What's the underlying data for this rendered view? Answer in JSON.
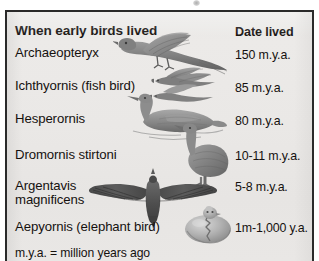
{
  "figure": {
    "title": "When early birds lived",
    "columns": {
      "name_header": "When early birds lived",
      "date_header": "Date lived"
    },
    "rows": [
      {
        "name": "Archaeopteryx",
        "date": "150 m.y.a.",
        "art": "bird-flying-archaeopteryx"
      },
      {
        "name": "Ichthyornis (fish bird)",
        "date": "85 m.y.a.",
        "art": "bird-gliding-ichthyornis"
      },
      {
        "name": "Hesperornis",
        "date": "80 m.y.a.",
        "art": "bird-swimming-hesperornis"
      },
      {
        "name": "Dromornis stirtoni",
        "date": "10-11 m.y.a.",
        "art": "bird-standing-dromornis"
      },
      {
        "name": "Argentavis\nmagnificens",
        "date": "5-8 m.y.a.",
        "art": "bird-soaring-argentavis"
      },
      {
        "name": "Aepyornis (elephant bird)",
        "date": "1m-1,000 y.a.",
        "art": "egg-hatching-aepyornis"
      }
    ],
    "footnote": "m.y.a. = million years ago"
  },
  "colors": {
    "border": "#2a2a2a",
    "paper": "#eae8e6",
    "text": "#15110f",
    "art_dark": "#5f5f5f",
    "art_mid": "#8d8d8d",
    "art_light": "#b9b9b9"
  }
}
